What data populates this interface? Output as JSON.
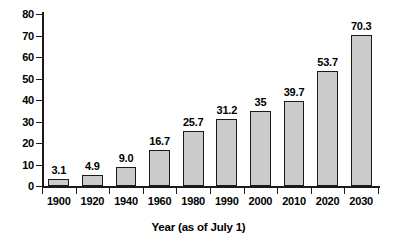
{
  "chart_data": {
    "type": "bar",
    "title": "",
    "subtitle": "",
    "xlabel": "Year (as of July 1)",
    "ylabel": "",
    "categories": [
      "1900",
      "1920",
      "1940",
      "1960",
      "1980",
      "1990",
      "2000",
      "2010",
      "2020",
      "2030"
    ],
    "values": [
      3.1,
      4.9,
      9.0,
      16.7,
      25.7,
      31.2,
      35,
      39.7,
      53.7,
      70.3
    ],
    "data_labels": [
      "3.1",
      "4.9",
      "9.0",
      "16.7",
      "25.7",
      "31.2",
      "35",
      "39.7",
      "53.7",
      "70.3"
    ],
    "ylim": [
      0,
      80
    ],
    "xlim_note": "categorical",
    "ytick_labels": [
      "0",
      "10",
      "20",
      "30",
      "40",
      "50",
      "60",
      "70",
      "80"
    ],
    "ytick_values": [
      0,
      10,
      20,
      30,
      40,
      50,
      60,
      70,
      80
    ],
    "grid": false,
    "legend": null,
    "legend_position": "none",
    "bar_fill_color": "#cbcbcb",
    "bar_edge_color": "#1a1a1a",
    "axis_color": "#1a1a1a",
    "text_color": "#000000",
    "background_color": "#ffffff"
  }
}
